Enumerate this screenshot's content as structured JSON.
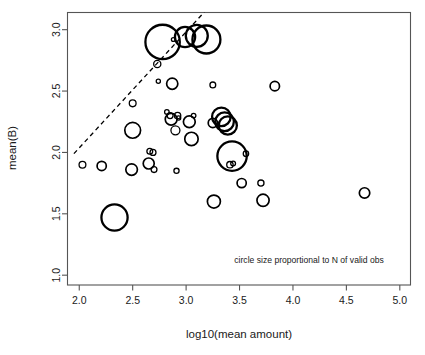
{
  "chart_data": {
    "type": "scatter",
    "title": "",
    "xlabel": "log10(mean amount)",
    "ylabel": "mean(B)",
    "xlim": [
      1.89,
      5.1
    ],
    "ylim": [
      0.92,
      3.14
    ],
    "xticks": [
      2.0,
      2.5,
      3.0,
      3.5,
      4.0,
      4.5,
      5.0
    ],
    "xticklabels": [
      "2.0",
      "2.5",
      "3.0",
      "3.5",
      "4.0",
      "4.5",
      "5.0"
    ],
    "yticks": [
      1.0,
      1.5,
      2.0,
      2.5,
      3.0
    ],
    "yticklabels": [
      "1.0",
      "1.5",
      "2.0",
      "2.5",
      "3.0"
    ],
    "grid": false,
    "legend": null,
    "annotations": [
      {
        "name": "circle-size-note",
        "text": "circle size proportional to N of valid obs",
        "x": 4.85,
        "y": 1.1,
        "align": "end"
      }
    ],
    "marker": {
      "style": "open-circle",
      "edge_color": "#000000",
      "fill": "none",
      "size_meaning": "radius proportional to N of valid obs"
    },
    "reference_line": {
      "name": "dashed-diagonal",
      "style": "dashed",
      "color": "#000000",
      "x0": 1.95,
      "y0": 1.99,
      "x1": 3.41,
      "y1": 3.37
    },
    "x": [
      2.03,
      2.21,
      2.33,
      2.49,
      2.5,
      2.5,
      2.65,
      2.66,
      2.69,
      2.7,
      2.73,
      2.74,
      2.78,
      2.82,
      2.85,
      2.86,
      2.87,
      2.88,
      2.9,
      2.91,
      2.92,
      2.93,
      2.99,
      3.03,
      3.05,
      3.07,
      3.1,
      3.19,
      3.25,
      3.25,
      3.26,
      3.33,
      3.36,
      3.39,
      3.41,
      3.43,
      3.44,
      3.52,
      3.56,
      3.7,
      3.72,
      3.83,
      4.67
    ],
    "y": [
      1.9,
      1.89,
      1.47,
      1.86,
      2.18,
      2.4,
      1.91,
      2.01,
      2.0,
      1.86,
      2.72,
      2.58,
      2.9,
      2.33,
      2.3,
      2.27,
      2.56,
      2.92,
      2.18,
      1.85,
      2.3,
      2.28,
      2.94,
      2.25,
      2.11,
      2.3,
      2.95,
      2.92,
      2.24,
      2.55,
      1.6,
      2.29,
      2.25,
      2.22,
      1.9,
      1.97,
      1.91,
      1.75,
      1.99,
      1.75,
      1.61,
      2.54,
      1.67
    ],
    "r_px": [
      3.4,
      4.6,
      13.1,
      5.8,
      7.9,
      3.4,
      5.5,
      2.9,
      3.0,
      2.9,
      3.6,
      2.1,
      17.2,
      2.3,
      3.0,
      5.9,
      5.6,
      1.9,
      4.5,
      2.6,
      3.2,
      2.1,
      10.1,
      5.9,
      6.7,
      2.3,
      11.0,
      14.0,
      4.6,
      2.9,
      6.5,
      9.3,
      9.3,
      9.1,
      3.2,
      14.7,
      2.4,
      4.6,
      2.7,
      3.1,
      6.1,
      4.7,
      5.2
    ]
  },
  "axes": {
    "x_axis_name": "x-axis",
    "y_axis_name": "y-axis"
  }
}
